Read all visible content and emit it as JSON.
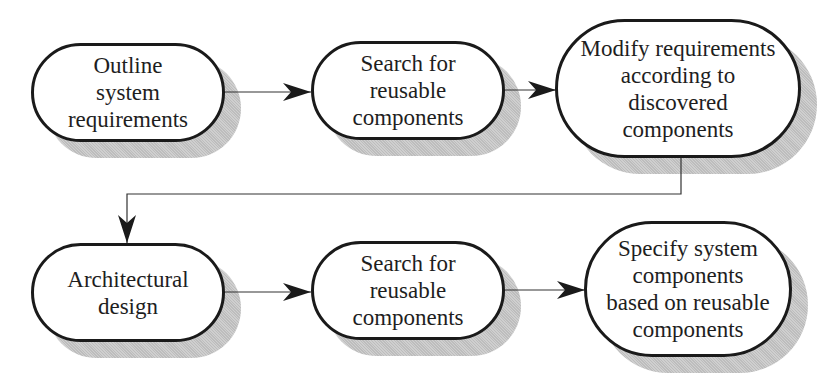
{
  "diagram": {
    "type": "process flow",
    "nodes": [
      {
        "id": "n1",
        "label": "Outline\nsystem\nrequirements"
      },
      {
        "id": "n2",
        "label": "Search for\nreusable\ncomponents"
      },
      {
        "id": "n3",
        "label": "Modify requirements\naccording to\ndiscovered\ncomponents"
      },
      {
        "id": "n4",
        "label": "Architectural\ndesign"
      },
      {
        "id": "n5",
        "label": "Search for\nreusable\ncomponents"
      },
      {
        "id": "n6",
        "label": "Specify system\ncomponents\nbased on reusable\ncomponents"
      }
    ],
    "edges": [
      {
        "from": "n1",
        "to": "n2"
      },
      {
        "from": "n2",
        "to": "n3"
      },
      {
        "from": "n3",
        "to": "n4"
      },
      {
        "from": "n4",
        "to": "n5"
      },
      {
        "from": "n5",
        "to": "n6"
      }
    ]
  },
  "colors": {
    "stroke": "#1a1a1a",
    "shadow": "#c4c4c4",
    "background": "#ffffff"
  }
}
